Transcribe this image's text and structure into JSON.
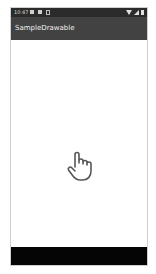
{
  "status_bar": {
    "time": "10:47",
    "left_icons": [
      "notification-icon",
      "sim-icon",
      "info-icon"
    ],
    "right_icons": [
      "wifi-icon",
      "signal-icon",
      "battery-icon"
    ]
  },
  "app_bar": {
    "title": "SampleDrawable"
  },
  "content": {
    "center_icon": "hand-pointer-icon"
  },
  "colors": {
    "status_bar": "#2b2b2b",
    "app_bar": "#424242",
    "background": "#ffffff",
    "nav_bar": "#050505",
    "icon_stroke": "#555555"
  }
}
